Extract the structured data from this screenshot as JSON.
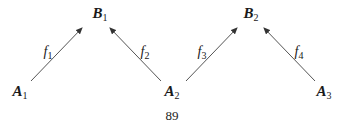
{
  "diagram": {
    "nodes": [
      {
        "id": "B1",
        "letter": "B",
        "sub": "1",
        "x": 100,
        "y": 14
      },
      {
        "id": "B2",
        "letter": "B",
        "sub": "2",
        "x": 251,
        "y": 14
      },
      {
        "id": "A1",
        "letter": "A",
        "sub": "1",
        "x": 20,
        "y": 92
      },
      {
        "id": "A2",
        "letter": "A",
        "sub": "2",
        "x": 172,
        "y": 92
      },
      {
        "id": "A3",
        "letter": "A",
        "sub": "3",
        "x": 324,
        "y": 92
      }
    ],
    "edges": [
      {
        "from": "A1",
        "to": "B1",
        "label_letter": "f",
        "label_sub": "1",
        "x1": 31,
        "y1": 81,
        "x2": 82,
        "y2": 28,
        "lx": 48,
        "ly": 52
      },
      {
        "from": "A2",
        "to": "B1",
        "label_letter": "f",
        "label_sub": "2",
        "x1": 161,
        "y1": 81,
        "x2": 110,
        "y2": 28,
        "lx": 145,
        "ly": 52
      },
      {
        "from": "A2",
        "to": "B2",
        "label_letter": "f",
        "label_sub": "3",
        "x1": 186,
        "y1": 81,
        "x2": 237,
        "y2": 28,
        "lx": 202,
        "ly": 52
      },
      {
        "from": "A3",
        "to": "B2",
        "label_letter": "f",
        "label_sub": "4",
        "x1": 315,
        "y1": 81,
        "x2": 264,
        "y2": 28,
        "lx": 299,
        "ly": 52
      }
    ],
    "colors": {
      "arrow": "#555555",
      "text": "#1a1a1a"
    }
  },
  "page": {
    "number": "89"
  }
}
